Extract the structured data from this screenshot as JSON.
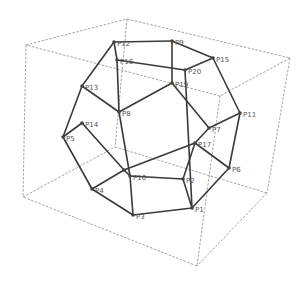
{
  "diagram": {
    "title": "",
    "type": "dodecahedron-wireframe",
    "colors": {
      "edge": "#3a3a3a",
      "box": "#8a8a8a",
      "label": "#555555",
      "background": "#ffffff"
    },
    "box_corners": {
      "A": [
        26,
        45
      ],
      "B": [
        127,
        19
      ],
      "C": [
        290,
        58
      ],
      "D": [
        220,
        96
      ],
      "E": [
        23,
        197
      ],
      "F": [
        115,
        147
      ],
      "G": [
        267,
        193
      ],
      "H": [
        197,
        266
      ]
    },
    "box_edges": [
      [
        "A",
        "B"
      ],
      [
        "B",
        "C"
      ],
      [
        "C",
        "D"
      ],
      [
        "D",
        "A"
      ],
      [
        "E",
        "F"
      ],
      [
        "F",
        "G"
      ],
      [
        "G",
        "H"
      ],
      [
        "H",
        "E"
      ],
      [
        "A",
        "E"
      ],
      [
        "B",
        "F"
      ],
      [
        "C",
        "G"
      ],
      [
        "D",
        "H"
      ]
    ],
    "vertices": [
      {
        "id": "P12",
        "label": "P12",
        "x": 114,
        "y": 42
      },
      {
        "id": "P9",
        "label": "P9",
        "x": 172,
        "y": 41
      },
      {
        "id": "P15",
        "label": "P15",
        "x": 213,
        "y": 58
      },
      {
        "id": "P16",
        "label": "P16",
        "x": 117,
        "y": 60
      },
      {
        "id": "P20",
        "label": "P20",
        "x": 185,
        "y": 70
      },
      {
        "id": "P19",
        "label": "P19",
        "x": 172,
        "y": 83
      },
      {
        "id": "P13",
        "label": "P13",
        "x": 82,
        "y": 86
      },
      {
        "id": "P8",
        "label": "P8",
        "x": 119,
        "y": 112
      },
      {
        "id": "P11",
        "label": "P11",
        "x": 240,
        "y": 113
      },
      {
        "id": "P14",
        "label": "P14",
        "x": 82,
        "y": 123
      },
      {
        "id": "P7",
        "label": "P7",
        "x": 209,
        "y": 128
      },
      {
        "id": "P5",
        "label": "P5",
        "x": 63,
        "y": 137
      },
      {
        "id": "P17",
        "label": "P17",
        "x": 195,
        "y": 143
      },
      {
        "id": "P6",
        "label": "P6",
        "x": 229,
        "y": 168
      },
      {
        "id": "P18",
        "label": "",
        "x": 124,
        "y": 170
      },
      {
        "id": "P10",
        "label": "P10",
        "x": 130,
        "y": 176
      },
      {
        "id": "P2",
        "label": "P2",
        "x": 183,
        "y": 179
      },
      {
        "id": "P4",
        "label": "P4",
        "x": 92,
        "y": 189
      },
      {
        "id": "P1",
        "label": "P1",
        "x": 192,
        "y": 208
      },
      {
        "id": "P3",
        "label": "P3",
        "x": 133,
        "y": 215
      }
    ],
    "edges": [
      [
        "P12",
        "P9"
      ],
      [
        "P9",
        "P15"
      ],
      [
        "P12",
        "P16"
      ],
      [
        "P16",
        "P20"
      ],
      [
        "P20",
        "P15"
      ],
      [
        "P9",
        "P19"
      ],
      [
        "P20",
        "P1"
      ],
      [
        "P12",
        "P13"
      ],
      [
        "P13",
        "P5"
      ],
      [
        "P13",
        "P8"
      ],
      [
        "P16",
        "P8"
      ],
      [
        "P19",
        "P8"
      ],
      [
        "P19",
        "P7"
      ],
      [
        "P7",
        "P11"
      ],
      [
        "P15",
        "P11"
      ],
      [
        "P7",
        "P17"
      ],
      [
        "P11",
        "P6"
      ],
      [
        "P17",
        "P6"
      ],
      [
        "P14",
        "P5"
      ],
      [
        "P14",
        "P18"
      ],
      [
        "P8",
        "P10"
      ],
      [
        "P17",
        "P18"
      ],
      [
        "P18",
        "P10"
      ],
      [
        "P10",
        "P2"
      ],
      [
        "P10",
        "P3"
      ],
      [
        "P2",
        "P17"
      ],
      [
        "P2",
        "P1"
      ],
      [
        "P5",
        "P4"
      ],
      [
        "P4",
        "P18"
      ],
      [
        "P4",
        "P3"
      ],
      [
        "P3",
        "P1"
      ],
      [
        "P1",
        "P6"
      ]
    ]
  }
}
